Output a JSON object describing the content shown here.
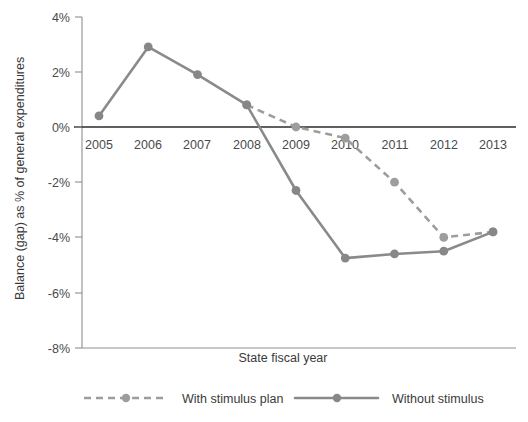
{
  "chart_data": {
    "type": "line",
    "title": "",
    "xlabel": "State fiscal year",
    "ylabel": "Balance (gap) as % of general expenditures",
    "categories": [
      "2005",
      "2006",
      "2007",
      "2008",
      "2009",
      "2010",
      "2011",
      "2012",
      "2013"
    ],
    "ylim": [
      -8,
      4
    ],
    "yticks": [
      4,
      2,
      0,
      -2,
      -4,
      -6,
      -8
    ],
    "ytick_labels": [
      "4%",
      "2%",
      "0%",
      "-2%",
      "-4%",
      "-6%",
      "-8%"
    ],
    "grid": false,
    "legend_position": "bottom",
    "series": [
      {
        "name": "With stimulus plan",
        "style": "dashed",
        "color": "#9d9d9d",
        "x": [
          "2008",
          "2009",
          "2010",
          "2011",
          "2012",
          "2013"
        ],
        "values": [
          0.8,
          0.0,
          -0.4,
          -2.0,
          -4.0,
          -3.8
        ]
      },
      {
        "name": "Without stimulus",
        "style": "solid",
        "color": "#878787",
        "x": [
          "2005",
          "2006",
          "2007",
          "2008",
          "2009",
          "2010",
          "2011",
          "2012",
          "2013"
        ],
        "values": [
          0.4,
          2.9,
          1.9,
          0.8,
          -2.3,
          -4.75,
          -4.6,
          -4.5,
          -3.8
        ]
      }
    ]
  },
  "legend": {
    "items": [
      {
        "label": "With stimulus plan",
        "style": "dashed"
      },
      {
        "label": "Without stimulus",
        "style": "solid"
      }
    ]
  },
  "colors": {
    "solid_series": "#878787",
    "dashed_series": "#9d9d9d",
    "zero_line": "#2b2b2b",
    "axis": "#8f8f8f",
    "text": "#3a3a3a"
  }
}
